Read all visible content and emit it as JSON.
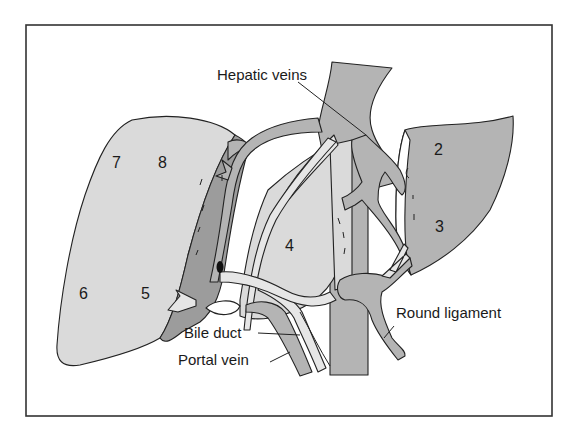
{
  "figure": {
    "colors": {
      "frame": "#333333",
      "liver_light": "#dadada",
      "liver_medium": "#b4b4b4",
      "liver_dark": "#9c9c9c",
      "vessel_pale": "#e6e6e6",
      "ink": "#1a1a1a"
    },
    "labels": {
      "hepatic_veins": "Hepatic veins",
      "bile_duct": "Bile duct",
      "portal_vein": "Portal vein",
      "round_ligament": "Round ligament"
    },
    "segments": {
      "s2": "2",
      "s3": "3",
      "s4": "4",
      "s5": "5",
      "s6": "6",
      "s7": "7",
      "s8": "8"
    }
  }
}
